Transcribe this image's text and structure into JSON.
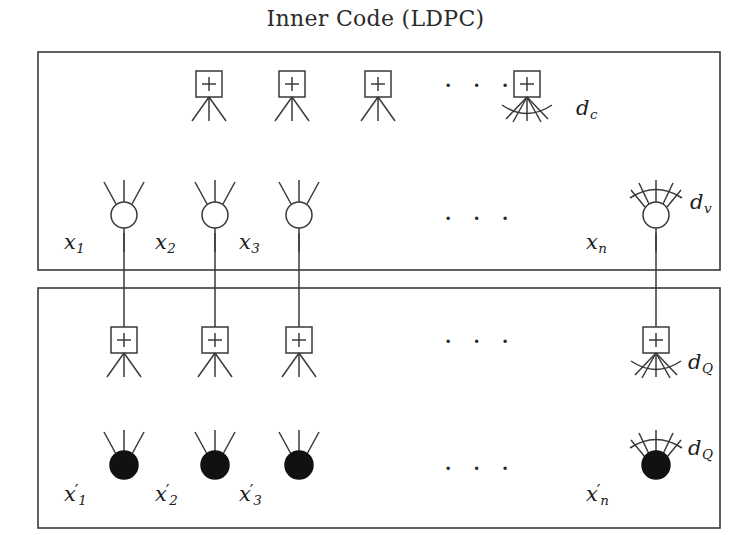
{
  "figure": {
    "title": "Inner Code (LDPC)",
    "width": 751,
    "height": 535,
    "stroke_color": "#3a3a3a",
    "node_fill_open": "#ffffff",
    "node_fill_solid": "#111111",
    "background": "#ffffff"
  },
  "boxes": {
    "inner_code_box": {
      "x": 38,
      "y": 52,
      "w": 682,
      "h": 218
    },
    "outer_code_box": {
      "x": 38,
      "y": 288,
      "w": 682,
      "h": 240
    }
  },
  "ellipses": {
    "check_row_top": "· · ·",
    "variable_row_top": "· · ·",
    "check_row_bottom": "· · ·",
    "variable_row_bottom": "· · ·"
  },
  "degree_labels": {
    "check_top": "d",
    "check_top_sub": "c",
    "variable_top": "d",
    "variable_top_sub": "v",
    "check_bottom": "d",
    "check_bottom_sub": "Q",
    "variable_bottom": "d",
    "variable_bottom_sub": "Q"
  },
  "variable_nodes_top": [
    {
      "name": "x",
      "sub": "1",
      "cx": 124,
      "cy": 215
    },
    {
      "name": "x",
      "sub": "2",
      "cx": 215,
      "cy": 215
    },
    {
      "name": "x",
      "sub": "3",
      "cx": 299,
      "cy": 215
    },
    {
      "name": "x",
      "sub": "n",
      "cx": 656,
      "cy": 215
    }
  ],
  "variable_nodes_bottom": [
    {
      "name": "x",
      "prime": "′",
      "sub": "1",
      "cx": 124,
      "cy": 465
    },
    {
      "name": "x",
      "prime": "′",
      "sub": "2",
      "cx": 215,
      "cy": 465
    },
    {
      "name": "x",
      "prime": "′",
      "sub": "3",
      "cx": 299,
      "cy": 465
    },
    {
      "name": "x",
      "prime": "′",
      "sub": "n",
      "cx": 656,
      "cy": 465
    }
  ],
  "check_nodes_top": [
    {
      "cx": 209,
      "cy": 84,
      "legs": 3
    },
    {
      "cx": 292,
      "cy": 84,
      "legs": 3
    },
    {
      "cx": 378,
      "cy": 84,
      "legs": 3
    },
    {
      "cx": 527,
      "cy": 84,
      "legs": 5
    }
  ],
  "check_nodes_bottom": [
    {
      "cx": 124,
      "cy": 340,
      "legs": 3
    },
    {
      "cx": 215,
      "cy": 340,
      "legs": 3
    },
    {
      "cx": 299,
      "cy": 340,
      "legs": 3
    },
    {
      "cx": 656,
      "cy": 340,
      "legs": 5
    }
  ],
  "node_symbols": {
    "check_symbol": "+",
    "check_shape": "square",
    "variable_shape_top": "open-circle",
    "variable_shape_bottom": "filled-circle"
  }
}
